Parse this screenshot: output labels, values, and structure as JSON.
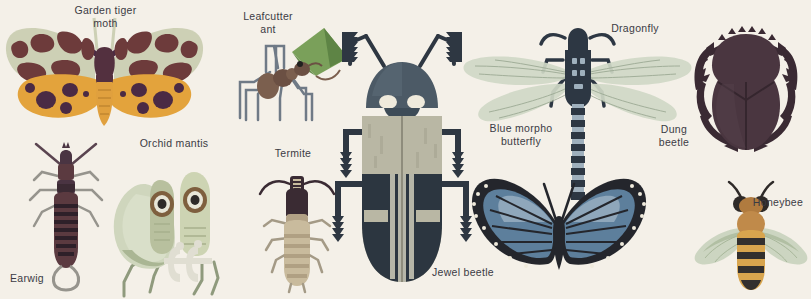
{
  "poster": {
    "background_color": "#f4f0e8",
    "label_color": "#3b3b44"
  },
  "specimens": [
    {
      "id": "garden-tiger-moth",
      "label": "Garden tiger\nmoth",
      "label_x": 58,
      "label_y": 4,
      "label_w": 95,
      "fig_x": 0,
      "fig_y": 18,
      "fig_w": 205,
      "fig_h": 125,
      "colors": {
        "forewing": "#cdd0b5",
        "forewing_spots": "#6d3b3b",
        "hindwing": "#e3a33c",
        "hindwing_spots": "#4a2a44",
        "body": "#53303f",
        "abdomen": "#e0a03e",
        "antenna": "#4a2a44"
      }
    },
    {
      "id": "leafcutter-ant",
      "label": "Leafcutter\nant",
      "label_x": 226,
      "label_y": 10,
      "label_w": 84,
      "fig_x": 228,
      "fig_y": 26,
      "fig_w": 120,
      "fig_h": 105,
      "colors": {
        "body": "#7b5f4e",
        "leaf": "#7aa05a",
        "leaf_dark": "#5e8445",
        "legs": "#6f7a86"
      }
    },
    {
      "id": "jewel-beetle",
      "label": "Jewel beetle",
      "label_x": 418,
      "label_y": 266,
      "label_w": 90,
      "fig_x": 330,
      "fig_y": 26,
      "fig_w": 145,
      "fig_h": 265,
      "colors": {
        "pronotum": "#3d4b57",
        "elytra_light": "#b9b7a4",
        "elytra_dark": "#2c3640",
        "legs": "#2e3742",
        "eye": "#efeadc"
      }
    },
    {
      "id": "dragonfly",
      "label": "Dragonfly",
      "label_x": 600,
      "label_y": 22,
      "label_w": 70,
      "fig_x": 455,
      "fig_y": 18,
      "fig_w": 245,
      "fig_h": 180,
      "colors": {
        "wing": "#cfd8c5",
        "wing_vein": "#9aa892",
        "thorax": "#3a4450",
        "abdomen_band": "#3a4450",
        "abdomen_light": "#9fb0bd"
      }
    },
    {
      "id": "dung-beetle",
      "label": "Dung\nbeetle",
      "label_x": 647,
      "label_y": 123,
      "label_w": 54,
      "fig_x": 690,
      "fig_y": 22,
      "fig_w": 110,
      "fig_h": 135,
      "colors": {
        "body": "#4a3640",
        "body_dark": "#3a2a33",
        "legs": "#3a2a33"
      }
    },
    {
      "id": "earwig",
      "label": "Earwig",
      "label_x": 2,
      "label_y": 272,
      "label_w": 50,
      "fig_x": 18,
      "fig_y": 145,
      "fig_w": 95,
      "fig_h": 150,
      "colors": {
        "body": "#4a3442",
        "abdomen": "#5b3a40",
        "stripes": "#2e2029",
        "legs": "#96948d",
        "pincers": "#96948d"
      }
    },
    {
      "id": "orchid-mantis",
      "label": "Orchid mantis",
      "label_x": 124,
      "label_y": 137,
      "label_w": 100,
      "fig_x": 104,
      "fig_y": 160,
      "fig_w": 130,
      "fig_h": 135,
      "colors": {
        "wing": "#cfd6bd",
        "wing_dark": "#aab694",
        "body": "#b8c09e",
        "eye_ring": "#7e5f3e",
        "eye": "#2e2a28",
        "legs": "#8f9a7d",
        "raptor": "#e0ded2"
      }
    },
    {
      "id": "termite",
      "label": "Termite",
      "label_x": 258,
      "label_y": 147,
      "label_w": 70,
      "fig_x": 252,
      "fig_y": 170,
      "fig_w": 90,
      "fig_h": 120,
      "colors": {
        "head": "#3a2b33",
        "thorax": "#b2a185",
        "abdomen": "#c9bb9d",
        "bands": "#b0a083",
        "legs": "#a49a86",
        "mandible": "#3a2b33"
      }
    },
    {
      "id": "blue-morpho-butterfly",
      "label": "Blue morpho\nbutterfly",
      "label_x": 476,
      "label_y": 122,
      "label_w": 90,
      "fig_x": 458,
      "fig_y": 168,
      "fig_w": 200,
      "fig_h": 128,
      "colors": {
        "wing": "#5d7f9c",
        "wing_light": "#8fa7bb",
        "border": "#24262c",
        "spots": "#efeadc",
        "body": "#24262c"
      }
    },
    {
      "id": "honeybee",
      "label": "Honeybee",
      "label_x": 745,
      "label_y": 196,
      "label_w": 66,
      "fig_x": 695,
      "fig_y": 182,
      "fig_w": 112,
      "fig_h": 110,
      "colors": {
        "wing": "#c8d2bc",
        "thorax": "#c08a4a",
        "abdomen": "#d8a54e",
        "stripes": "#33302e",
        "eyes": "#2e2a28",
        "antenna": "#2e2a28"
      }
    }
  ]
}
